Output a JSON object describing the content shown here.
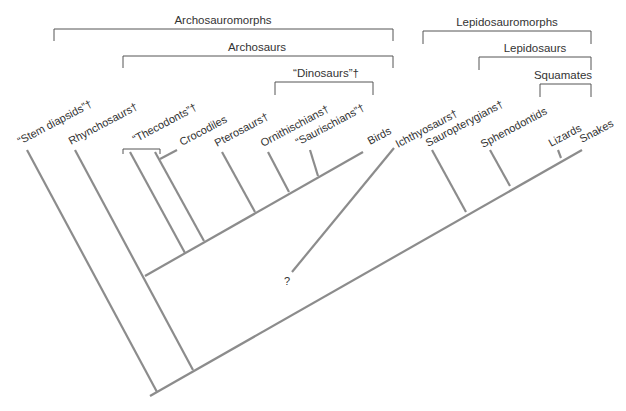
{
  "colors": {
    "branch": "#8c8c8c",
    "bracket": "#555555",
    "text": "#333333",
    "background": "#ffffff"
  },
  "groups": [
    {
      "id": "archosauromorphs",
      "label": "Archosauromorphs",
      "x1": 54,
      "x2": 393,
      "y": 29,
      "tick": 12,
      "lx": 223,
      "ly": 24
    },
    {
      "id": "archosaurs",
      "label": "Archosaurs",
      "x1": 123,
      "x2": 393,
      "y": 56,
      "tick": 12,
      "lx": 257,
      "ly": 51
    },
    {
      "id": "dinosaurs",
      "label": "“Dinosaurs”†",
      "x1": 275,
      "x2": 373,
      "y": 82,
      "tick": 13,
      "lx": 326,
      "ly": 77
    },
    {
      "id": "lepidosauromorphs",
      "label": "Lepidosauromorphs",
      "x1": 423,
      "x2": 591,
      "y": 31,
      "tick": 13,
      "lx": 507,
      "ly": 26
    },
    {
      "id": "lepidosaurs",
      "label": "Lepidosaurs",
      "x1": 479,
      "x2": 591,
      "y": 57,
      "tick": 13,
      "lx": 535,
      "ly": 52
    },
    {
      "id": "squamates",
      "label": "Squamates",
      "x1": 540,
      "x2": 591,
      "y": 84,
      "tick": 13,
      "lx": 563,
      "ly": 79
    }
  ],
  "taxa": [
    {
      "id": "stem-diapsids",
      "label": "“Stem diapsids”†",
      "x": 20,
      "y": 145,
      "extinct": true
    },
    {
      "id": "rhynchosaurs",
      "label": "Rhynchosaurs†",
      "x": 71,
      "y": 145,
      "extinct": true
    },
    {
      "id": "thecodonts",
      "label": "“Thecodonts”†",
      "x": 135,
      "y": 143,
      "extinct": true
    },
    {
      "id": "crocodiles",
      "label": "Crocodiles",
      "x": 182,
      "y": 146,
      "extinct": false
    },
    {
      "id": "pterosaurs",
      "label": "Pterosaurs†",
      "x": 217,
      "y": 147,
      "extinct": true
    },
    {
      "id": "ornithischians",
      "label": "Ornithischians†",
      "x": 263,
      "y": 147,
      "extinct": true
    },
    {
      "id": "saurischians",
      "label": "“Saurischians”†",
      "x": 298,
      "y": 146,
      "extinct": true
    },
    {
      "id": "birds",
      "label": "Birds",
      "x": 370,
      "y": 145,
      "extinct": false
    },
    {
      "id": "ichthyosaurs",
      "label": "Ichthyosaurs†",
      "x": 398,
      "y": 148,
      "extinct": true
    },
    {
      "id": "sauropterygians",
      "label": "Sauropterygians†",
      "x": 428,
      "y": 147,
      "extinct": true
    },
    {
      "id": "sphenodontids",
      "label": "Sphenodontids",
      "x": 483,
      "y": 148,
      "extinct": false
    },
    {
      "id": "lizards",
      "label": "Lizards",
      "x": 551,
      "y": 147,
      "extinct": false
    },
    {
      "id": "snakes",
      "label": "Snakes",
      "x": 582,
      "y": 143,
      "extinct": false
    }
  ],
  "unknown_marker": {
    "label": "?",
    "x": 284,
    "y": 285
  },
  "thecodont_bracket": {
    "x1": 123,
    "x2": 160,
    "y": 149,
    "tick": 5
  },
  "edges": [
    {
      "id": "main-trunk",
      "x1": 150,
      "y1": 396,
      "x2": 582,
      "y2": 150
    },
    {
      "id": "stem-diapsids",
      "x1": 27,
      "y1": 150,
      "x2": 157,
      "y2": 392
    },
    {
      "id": "rhynchosaurs",
      "x1": 75,
      "y1": 150,
      "x2": 193,
      "y2": 370
    },
    {
      "id": "archosaur-trunk",
      "x1": 145,
      "y1": 276,
      "x2": 363,
      "y2": 152
    },
    {
      "id": "thecodonts",
      "x1": 130,
      "y1": 152,
      "x2": 185,
      "y2": 253
    },
    {
      "id": "crocodiles",
      "x1": 155,
      "y1": 152,
      "x2": 204,
      "y2": 241
    },
    {
      "id": "crocodiles-stub",
      "x1": 160,
      "y1": 159,
      "x2": 177,
      "y2": 150
    },
    {
      "id": "pterosaurs",
      "x1": 222,
      "y1": 152,
      "x2": 255,
      "y2": 212
    },
    {
      "id": "ornithischians",
      "x1": 268,
      "y1": 152,
      "x2": 289,
      "y2": 192
    },
    {
      "id": "saurischians",
      "x1": 310,
      "y1": 150,
      "x2": 318,
      "y2": 176
    },
    {
      "id": "ichthyosaurs",
      "x1": 394,
      "y1": 148,
      "x2": 292,
      "y2": 272
    },
    {
      "id": "sauropterygians",
      "x1": 432,
      "y1": 150,
      "x2": 466,
      "y2": 212
    },
    {
      "id": "sphenodontids",
      "x1": 490,
      "y1": 150,
      "x2": 510,
      "y2": 186
    },
    {
      "id": "lizards",
      "x1": 558,
      "y1": 150,
      "x2": 561,
      "y2": 158
    }
  ]
}
